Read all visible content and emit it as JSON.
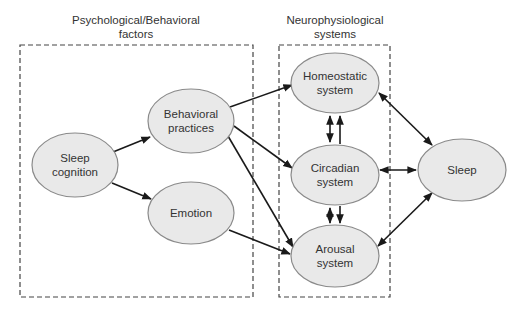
{
  "groups": {
    "psych": {
      "label_line1": "Psychological/Behavioral",
      "label_line2": "factors"
    },
    "neuro": {
      "label_line1": "Neurophysiological",
      "label_line2": "systems"
    }
  },
  "nodes": {
    "sleep_cognition": {
      "line1": "Sleep",
      "line2": "cognition"
    },
    "behavioral_practices": {
      "line1": "Behavioral",
      "line2": "practices"
    },
    "emotion": {
      "line1": "Emotion",
      "line2": ""
    },
    "homeostatic": {
      "line1": "Homeostatic",
      "line2": "system"
    },
    "circadian": {
      "line1": "Circadian",
      "line2": "system"
    },
    "arousal": {
      "line1": "Arousal",
      "line2": "system"
    },
    "sleep": {
      "line1": "Sleep",
      "line2": ""
    }
  },
  "edges": [
    {
      "from": "Sleep cognition",
      "to": "Behavioral practices",
      "type": "directed"
    },
    {
      "from": "Sleep cognition",
      "to": "Emotion",
      "type": "directed"
    },
    {
      "from": "Behavioral practices",
      "to": "Homeostatic system",
      "type": "directed"
    },
    {
      "from": "Behavioral practices",
      "to": "Circadian system",
      "type": "directed"
    },
    {
      "from": "Behavioral practices",
      "to": "Arousal system",
      "type": "directed"
    },
    {
      "from": "Emotion",
      "to": "Arousal system",
      "type": "directed"
    },
    {
      "from": "Homeostatic system",
      "to": "Circadian system",
      "type": "bidirectional"
    },
    {
      "from": "Circadian system",
      "to": "Homeostatic system",
      "type": "directed"
    },
    {
      "from": "Circadian system",
      "to": "Arousal system",
      "type": "bidirectional"
    },
    {
      "from": "Circadian system",
      "to": "Arousal system",
      "type": "directed"
    },
    {
      "from": "Homeostatic system",
      "to": "Sleep",
      "type": "bidirectional"
    },
    {
      "from": "Circadian system",
      "to": "Sleep",
      "type": "bidirectional"
    },
    {
      "from": "Arousal system",
      "to": "Sleep",
      "type": "bidirectional"
    }
  ],
  "colors": {
    "node_fill": "#e9e9e9",
    "node_stroke": "#8a8a8a",
    "edge": "#1a1a1a",
    "box": "#444444"
  }
}
